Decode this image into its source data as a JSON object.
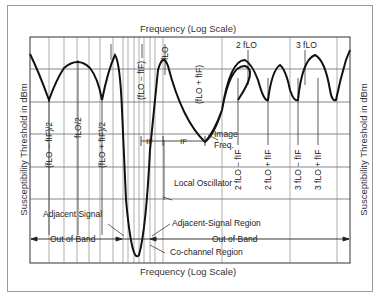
{
  "figure": {
    "x_axis_title_top": "Frequency (Log Scale)",
    "x_axis_title_bottom": "Frequency (Log Scale)",
    "y_axis_title_left": "Susceptibility Threshold in dBm",
    "y_axis_title_right": "Susceptibility Threshold in dBm"
  },
  "frequency_labels": {
    "flo_minus_fif_half": "(fLO − fIF)/2",
    "flo_half": "fLO/2",
    "flo_plus_fif_half": "(fLO + fIF)/2",
    "flo_minus_fif": "(fLO − fIF)",
    "flo": "fLO",
    "flo_plus_fif": "(fLO + fIF)",
    "two_flo": "2 fLO",
    "three_flo": "3 fLO",
    "two_flo_minus_fif": "2 fLO − fIF",
    "two_flo_plus_fif": "2 fLO + fIF",
    "three_flo_minus_fif": "3 fLO − fIF",
    "three_flo_plus_fif": "3 fLO + fIF"
  },
  "annotations": {
    "if_left": "IF",
    "if_right": "IF",
    "image_freq": "Image Freq.",
    "image_line1": "Image",
    "image_line2": "Freq.",
    "local_oscillator": "Local Oscillator",
    "adjacent_signal": "Adjacent Signal",
    "adjacent_signal_region": "Adjacent-Signal Region",
    "co_channel_region": "Co-channel Region",
    "out_of_band_left": "Out of Band",
    "out_of_band_right": "Out of Band"
  },
  "colors": {
    "curve": "#111111",
    "grid": "#555555",
    "text": "#2a2a2a",
    "frame": "#9a9a9a"
  }
}
